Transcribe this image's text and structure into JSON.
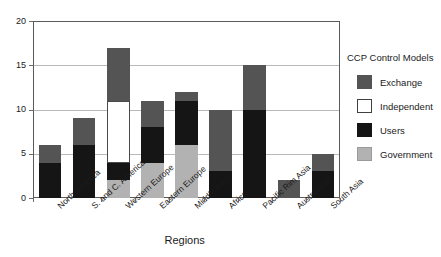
{
  "chart_data": {
    "type": "bar",
    "title": "",
    "xlabel": "Regions",
    "ylabel": "",
    "ylim": [
      0,
      20
    ],
    "yticks": [
      0,
      5,
      10,
      15,
      20
    ],
    "ytick_labels": [
      "0",
      "5",
      "10",
      "15",
      "20"
    ],
    "grid": true,
    "stacked": true,
    "legend_title": "CCP Control Models",
    "legend_position": "right",
    "categories": [
      "North America",
      "S. and C. America",
      "Western Europe",
      "Eastern Europe",
      "Middle East",
      "Africa",
      "Pacific Rim Asia",
      "Australasia",
      "South Asia"
    ],
    "series": [
      {
        "name": "Government",
        "color": "#b2b2b2",
        "values": [
          0,
          0,
          2,
          4,
          6,
          0,
          0,
          0,
          0
        ]
      },
      {
        "name": "Users",
        "color": "#151515",
        "values": [
          4,
          6,
          2,
          4,
          5,
          3,
          10,
          0,
          3
        ]
      },
      {
        "name": "Independent",
        "color": "#ffffff",
        "values": [
          0,
          0,
          7,
          0,
          0,
          0,
          0,
          0,
          0
        ]
      },
      {
        "name": "Exchange",
        "color": "#545454",
        "values": [
          2,
          3,
          6,
          3,
          1,
          7,
          5,
          2,
          2
        ]
      }
    ],
    "stack_order": [
      "Government",
      "Users",
      "Independent",
      "Exchange"
    ],
    "totals": [
      6,
      9,
      17,
      11,
      12,
      10,
      15,
      2,
      5
    ]
  },
  "legend": {
    "title": "CCP Control Models",
    "entries": [
      {
        "label": "Exchange",
        "swatch_class": "sw-exchange",
        "color": "#545454"
      },
      {
        "label": "Independent",
        "swatch_class": "sw-independent",
        "color": "#ffffff"
      },
      {
        "label": "Users",
        "swatch_class": "sw-users",
        "color": "#151515"
      },
      {
        "label": "Government",
        "swatch_class": "sw-government",
        "color": "#b2b2b2"
      }
    ]
  }
}
